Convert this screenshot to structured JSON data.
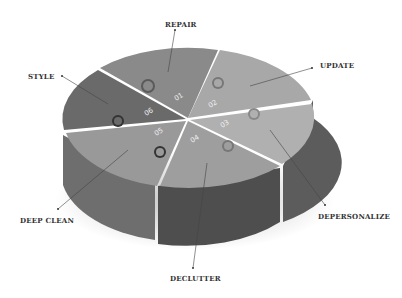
{
  "diagram": {
    "type": "3d-puzzle-pie",
    "segments": [
      {
        "number": "01",
        "label": "REPAIR"
      },
      {
        "number": "02",
        "label": "UPDATE"
      },
      {
        "number": "03",
        "label": "DEPERSONALIZE"
      },
      {
        "number": "04",
        "label": "DECLUTTER"
      },
      {
        "number": "05",
        "label": "DEEP CLEAN"
      },
      {
        "number": "06",
        "label": "STYLE"
      }
    ]
  }
}
